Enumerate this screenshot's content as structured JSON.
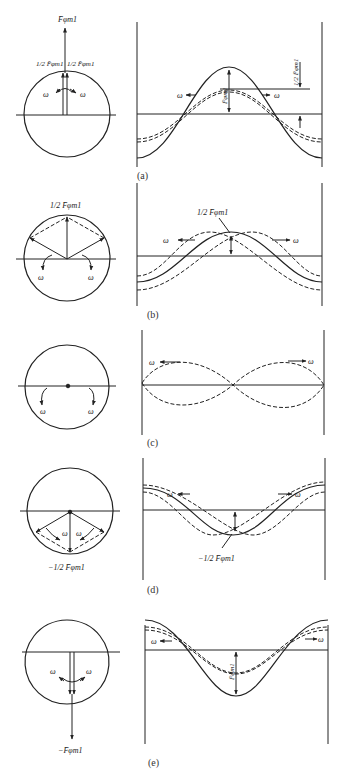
{
  "figure": {
    "panels": [
      {
        "id": "a",
        "caption": "(a)",
        "circle_labels": {
          "top": "F̄φm1",
          "left_half": "1/2 F̄φm1",
          "right_half": "1/2 F̄φm1",
          "omega_left": "ω",
          "omega_right": "ω"
        },
        "wave_labels": {
          "amplitude": "F̄φm1",
          "half_amplitude": "1/2 F̄φm1",
          "omega_left": "ω",
          "omega_right": "ω"
        }
      },
      {
        "id": "b",
        "caption": "(b)",
        "circle_labels": {
          "top": "1/2 F̄φm1",
          "omega_left": "ω",
          "omega_right": "ω"
        },
        "wave_labels": {
          "amplitude": "1/2 F̄φm1",
          "omega_left": "ω",
          "omega_right": "ω"
        }
      },
      {
        "id": "c",
        "caption": "(c)",
        "circle_labels": {
          "omega_left": "ω",
          "omega_right": "ω"
        },
        "wave_labels": {
          "omega_left": "ω",
          "omega_right": "ω"
        }
      },
      {
        "id": "d",
        "caption": "(d)",
        "circle_labels": {
          "bottom": "−1/2 F̄φm1",
          "omega_left": "ω",
          "omega_right": "ω"
        },
        "wave_labels": {
          "amplitude": "−1/2 F̄φm1",
          "omega_left": "ω",
          "omega_right": "ω"
        }
      },
      {
        "id": "e",
        "caption": "(e)",
        "circle_labels": {
          "bottom": "−F̄φm1",
          "omega_left": "ω",
          "omega_right": "ω"
        },
        "wave_labels": {
          "amplitude": "F̄φm1",
          "omega_left": "ω",
          "omega_right": "ω"
        }
      }
    ],
    "symbols": {
      "omega": "ω",
      "F": "F",
      "sub": "φm1",
      "half_num": "1",
      "half_den": "2",
      "minus": "−"
    },
    "colors": {
      "ink": "#222222",
      "background": "#ffffff"
    }
  }
}
